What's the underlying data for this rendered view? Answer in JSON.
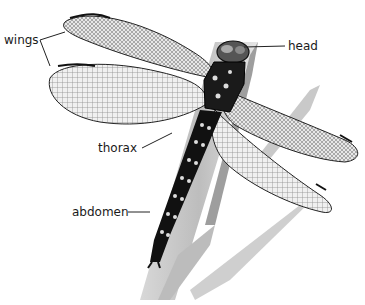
{
  "diagram": {
    "labels": {
      "wings": "wings",
      "head": "head",
      "thorax": "thorax",
      "abdomen": "abdomen"
    },
    "top_text_fragment": "...wings ... the head is ..."
  }
}
